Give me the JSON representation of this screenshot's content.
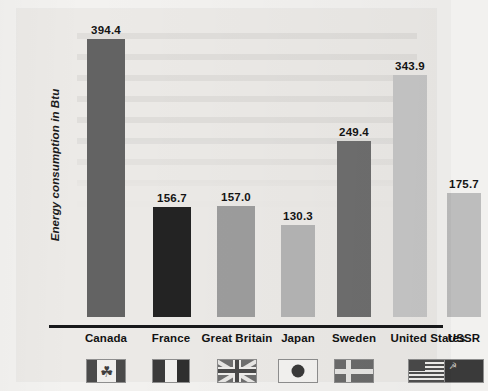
{
  "chart_data": {
    "type": "bar",
    "title": "",
    "xlabel": "",
    "ylabel": "Energy consumption in Btu",
    "categories": [
      "Canada",
      "France",
      "Great Britain",
      "Japan",
      "Sweden",
      "United States",
      "USSR"
    ],
    "values": [
      394.4,
      156.7,
      157.0,
      130.3,
      249.4,
      343.9,
      175.7
    ],
    "value_labels": [
      "394.4",
      "156.7",
      "157.0",
      "130.3",
      "249.4",
      "343.9",
      "175.7"
    ],
    "ylim": [
      0,
      420
    ],
    "grid": false,
    "legend": null,
    "bar_colors": [
      "#636363",
      "#232323",
      "#9d9d9d",
      "#b4b4b4",
      "#6e6e6e",
      "#c6c6c6",
      "#bdbdbd"
    ],
    "axis_color": "#17181a",
    "background": "#eceae7"
  },
  "axis": {
    "y_title": "Energy consumption in Btu"
  },
  "bars": [
    {
      "label": "Canada",
      "value": "394.4",
      "flag_name": "canada-flag"
    },
    {
      "label": "France",
      "value": "156.7",
      "flag_name": "france-flag"
    },
    {
      "label": "Great Britain",
      "value": "157.0",
      "flag_name": "great-britain-flag"
    },
    {
      "label": "Japan",
      "value": "130.3",
      "flag_name": "japan-flag"
    },
    {
      "label": "Sweden",
      "value": "249.4",
      "flag_name": "sweden-flag"
    },
    {
      "label": "United States",
      "value": "343.9",
      "flag_name": "united-states-flag"
    },
    {
      "label": "USSR",
      "value": "175.7",
      "flag_name": "ussr-flag"
    }
  ],
  "icons": {
    "maple_leaf": "☘",
    "hammer_sickle": "☭"
  }
}
